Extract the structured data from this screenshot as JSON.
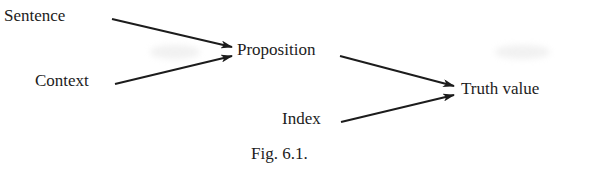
{
  "diagram": {
    "type": "flow",
    "nodes": [
      {
        "id": "sentence",
        "label": "Sentence"
      },
      {
        "id": "context",
        "label": "Context"
      },
      {
        "id": "proposition",
        "label": "Proposition"
      },
      {
        "id": "index",
        "label": "Index"
      },
      {
        "id": "truth_value",
        "label": "Truth value"
      }
    ],
    "edges": [
      {
        "from": "sentence",
        "to": "proposition"
      },
      {
        "from": "context",
        "to": "proposition"
      },
      {
        "from": "proposition",
        "to": "truth_value"
      },
      {
        "from": "index",
        "to": "truth_value"
      }
    ],
    "caption": "Fig. 6.1."
  },
  "colors": {
    "ink": "#1c1c1c",
    "background": "#ffffff"
  }
}
